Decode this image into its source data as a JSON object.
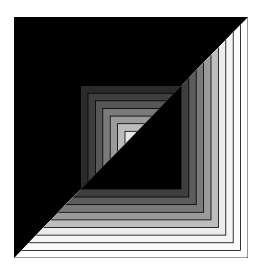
{
  "figure": {
    "caption_text": "",
    "background": "#000000",
    "outline_color": "#000000",
    "outer_bands": {
      "count": 9,
      "region": "lower-right triangle",
      "band_width": 7.4,
      "colors_outer_to_inner": [
        "#ffffff",
        "#fbfbfb",
        "#f5f5f5",
        "#ececec",
        "#bdbdbd",
        "#9a9a9a",
        "#7a7a7a",
        "#5c5c5c",
        "#3f3f3f"
      ]
    },
    "inner_bands": {
      "count": 8,
      "region": "upper-left triangle",
      "band_width": 7.4,
      "colors_outer_to_inner": [
        "#2a2a2a",
        "#3e3e3e",
        "#575757",
        "#7a7a7a",
        "#9a9a9a",
        "#bdbdbd",
        "#e6e6e6",
        "#f6f6f6"
      ]
    }
  }
}
